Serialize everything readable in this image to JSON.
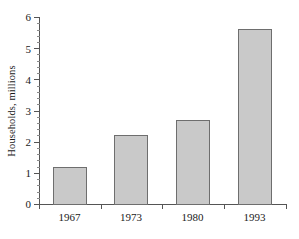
{
  "chart_data": {
    "type": "bar",
    "title": "",
    "subtitle": "",
    "xlabel": "",
    "ylabel": "Households, millions",
    "categories": [
      "1967",
      "1973",
      "1980",
      "1993"
    ],
    "values": [
      1.2,
      2.2,
      2.7,
      5.6
    ],
    "series": [
      {
        "name": "Households",
        "values": [
          1.2,
          2.2,
          2.7,
          5.6
        ]
      }
    ],
    "ylim": [
      0,
      6
    ],
    "y_ticks": [
      0,
      1,
      2,
      3,
      4,
      5,
      6
    ],
    "y_tick_labels": [
      "0",
      "1",
      "2",
      "3",
      "4",
      "5",
      "6"
    ],
    "y_minor_tick_step": 0.2,
    "grid": false,
    "legend": false,
    "legend_position": "none",
    "annotations": [],
    "colors": {
      "bar_fill": "#c9c9c9",
      "bar_stroke": "#6e6e6e",
      "axis": "#555555",
      "text": "#1a1a1a",
      "background": "#ffffff"
    }
  }
}
